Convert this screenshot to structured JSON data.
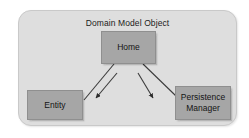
{
  "diagram": {
    "title": "Domain Model Object",
    "type": "block-diagram",
    "panel": {
      "fill": "#dedede",
      "border": "#c9c9c9"
    },
    "node_style": {
      "fill": "#a6a6a6",
      "border": "#8f8f8f",
      "text": "#141414"
    },
    "connector_color": "#2c2c2c",
    "nodes": [
      {
        "id": "home",
        "label": "Home",
        "x": 101,
        "y": 31,
        "width": 55,
        "height": 33
      },
      {
        "id": "entity",
        "label": "Entity",
        "x": 27,
        "y": 90,
        "width": 56,
        "height": 30
      },
      {
        "id": "persistence",
        "label": "Persistence\nManager",
        "line1": "Persistence",
        "line2": "Manager",
        "x": 175,
        "y": 86,
        "width": 56,
        "height": 34
      }
    ],
    "connectors": [
      {
        "id": "home-to-entity",
        "from": "home",
        "to": "entity",
        "arrowhead": false,
        "x1": 114,
        "y1": 64,
        "x2": 83,
        "y2": 100
      },
      {
        "id": "home-to-left-inner",
        "from": "home",
        "to": "unlabeled-left",
        "arrowhead": true,
        "x1": 117,
        "y1": 73,
        "x2": 97,
        "y2": 99
      },
      {
        "id": "home-to-right-inner",
        "from": "home",
        "to": "unlabeled-right",
        "arrowhead": true,
        "x1": 138,
        "y1": 73,
        "x2": 154,
        "y2": 99
      },
      {
        "id": "home-to-persistence",
        "from": "home",
        "to": "persistence",
        "arrowhead": false,
        "x1": 143,
        "y1": 64,
        "x2": 176,
        "y2": 96
      }
    ]
  }
}
